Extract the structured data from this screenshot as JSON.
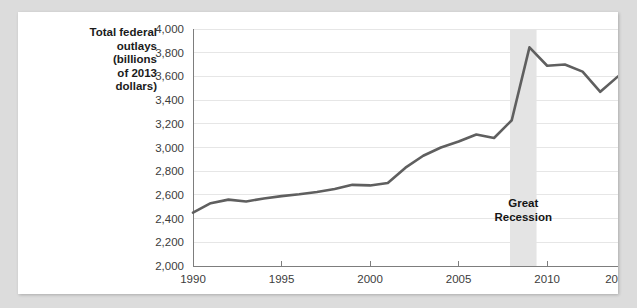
{
  "chart_data": {
    "type": "line",
    "title": "",
    "ylabel": "Total federal\noutlays\n(billions\nof 2013\ndollars)",
    "xlabel": "",
    "xlim": [
      1990,
      2014
    ],
    "ylim": [
      2000,
      4000
    ],
    "grid": true,
    "legend": null,
    "yticks": [
      "2,000",
      "2,200",
      "2,400",
      "2,600",
      "2,800",
      "3,000",
      "3,200",
      "3,400",
      "3,600",
      "3,800",
      "4,000"
    ],
    "ytick_values": [
      2000,
      2200,
      2400,
      2600,
      2800,
      3000,
      3200,
      3400,
      3600,
      3800,
      4000
    ],
    "xticks": [
      "1990",
      "1995",
      "2000",
      "2005",
      "2010",
      "2014"
    ],
    "xtick_values": [
      1990,
      1995,
      2000,
      2005,
      2010,
      2014
    ],
    "series": [
      {
        "name": "Total federal outlays",
        "x": [
          1990,
          1991,
          1992,
          1993,
          1994,
          1995,
          1996,
          1997,
          1998,
          1999,
          2000,
          2001,
          2002,
          2003,
          2004,
          2005,
          2006,
          2007,
          2008,
          2009,
          2010,
          2011,
          2012,
          2013,
          2014
        ],
        "values": [
          2450,
          2530,
          2560,
          2545,
          2570,
          2590,
          2605,
          2625,
          2650,
          2685,
          2680,
          2700,
          2830,
          2930,
          3000,
          3050,
          3110,
          3080,
          3230,
          3845,
          3690,
          3700,
          3640,
          3470,
          3600
        ]
      }
    ],
    "annotations": [
      {
        "name": "great-recession",
        "label": "Great\nRecession",
        "label_lines": [
          "Great",
          "Recession"
        ],
        "band_start": 2007.9,
        "band_end": 2009.4
      }
    ],
    "colors": {
      "line": "#5f5f5f",
      "gridline": "#e6e6e6",
      "axis": "#7d7d7d",
      "recession_band": "#e4e4e4",
      "page_background": "#dcdcdc",
      "card_background": "#ffffff",
      "text": "#1b1b1b"
    }
  }
}
